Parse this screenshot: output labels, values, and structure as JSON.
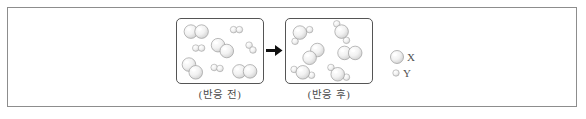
{
  "figure": {
    "type": "particle-model-reaction-diagram",
    "frame_color": "#8d8d8d",
    "panel_border_color": "#555555",
    "sphere_fill": "#efefef",
    "sphere_stroke": "#9a9a9a"
  },
  "panels": {
    "before": {
      "caption": "(반응 전)",
      "name": "before-reaction-panel",
      "molecules": [
        {
          "label": "X2",
          "atoms": [
            {
              "kind": "X",
              "cx": 14,
              "cy": 13,
              "r": 7.0
            },
            {
              "kind": "X",
              "cx": 25,
              "cy": 13,
              "r": 7.0
            }
          ]
        },
        {
          "label": "Y2",
          "atoms": [
            {
              "kind": "Y",
              "cx": 58,
              "cy": 11,
              "r": 3.4
            },
            {
              "kind": "Y",
              "cx": 64,
              "cy": 11,
              "r": 3.4
            }
          ]
        },
        {
          "label": "Y2",
          "atoms": [
            {
              "kind": "Y",
              "cx": 19,
              "cy": 30,
              "r": 3.4
            },
            {
              "kind": "Y",
              "cx": 25,
              "cy": 30,
              "r": 3.4
            }
          ]
        },
        {
          "label": "X2",
          "atoms": [
            {
              "kind": "X",
              "cx": 42,
              "cy": 27,
              "r": 7.0
            },
            {
              "kind": "X",
              "cx": 51,
              "cy": 33,
              "r": 7.0
            }
          ]
        },
        {
          "label": "Y2",
          "atoms": [
            {
              "kind": "Y",
              "cx": 74,
              "cy": 27,
              "r": 3.4
            },
            {
              "kind": "Y",
              "cx": 78,
              "cy": 32,
              "r": 3.4
            }
          ]
        },
        {
          "label": "X2",
          "atoms": [
            {
              "kind": "X",
              "cx": 12,
              "cy": 47,
              "r": 7.0
            },
            {
              "kind": "X",
              "cx": 19,
              "cy": 55,
              "r": 7.0
            }
          ]
        },
        {
          "label": "Y2",
          "atoms": [
            {
              "kind": "Y",
              "cx": 38,
              "cy": 50,
              "r": 3.4
            },
            {
              "kind": "Y",
              "cx": 44,
              "cy": 51,
              "r": 3.4
            }
          ]
        },
        {
          "label": "X2",
          "atoms": [
            {
              "kind": "X",
              "cx": 64,
              "cy": 54,
              "r": 7.0
            },
            {
              "kind": "X",
              "cx": 75,
              "cy": 54,
              "r": 7.0
            }
          ]
        }
      ]
    },
    "after": {
      "caption": "(반응 후)",
      "name": "after-reaction-panel",
      "molecules": [
        {
          "label": "XY2",
          "atoms": [
            {
              "kind": "X",
              "cx": 14,
              "cy": 14,
              "r": 7.0
            },
            {
              "kind": "Y",
              "cx": 24,
              "cy": 11,
              "r": 3.4
            },
            {
              "kind": "Y",
              "cx": 9,
              "cy": 23,
              "r": 3.4
            }
          ]
        },
        {
          "label": "XY2",
          "atoms": [
            {
              "kind": "X",
              "cx": 57,
              "cy": 13,
              "r": 7.0
            },
            {
              "kind": "Y",
              "cx": 52,
              "cy": 5,
              "r": 3.4
            },
            {
              "kind": "Y",
              "cx": 62,
              "cy": 22,
              "r": 3.4
            }
          ]
        },
        {
          "label": "X2",
          "atoms": [
            {
              "kind": "X",
              "cx": 32,
              "cy": 32,
              "r": 7.0
            },
            {
              "kind": "X",
              "cx": 24,
              "cy": 40,
              "r": 7.0
            }
          ]
        },
        {
          "label": "X2",
          "atoms": [
            {
              "kind": "X",
              "cx": 60,
              "cy": 35,
              "r": 7.0
            },
            {
              "kind": "X",
              "cx": 71,
              "cy": 35,
              "r": 7.0
            }
          ]
        },
        {
          "label": "XY2",
          "atoms": [
            {
              "kind": "X",
              "cx": 17,
              "cy": 55,
              "r": 7.0
            },
            {
              "kind": "Y",
              "cx": 8,
              "cy": 52,
              "r": 3.4
            },
            {
              "kind": "Y",
              "cx": 26,
              "cy": 58,
              "r": 3.4
            }
          ]
        },
        {
          "label": "XY2",
          "atoms": [
            {
              "kind": "X",
              "cx": 53,
              "cy": 57,
              "r": 7.0
            },
            {
              "kind": "Y",
              "cx": 46,
              "cy": 50,
              "r": 3.4
            },
            {
              "kind": "Y",
              "cx": 62,
              "cy": 60,
              "r": 3.4
            }
          ]
        }
      ]
    }
  },
  "arrow": {
    "name": "reaction-arrow",
    "direction": "right"
  },
  "legend": {
    "items": [
      {
        "label": "X",
        "kind": "X",
        "r": 6.5,
        "name": "legend-swatch-x"
      },
      {
        "label": "Y",
        "kind": "Y",
        "r": 3.2,
        "name": "legend-swatch-y"
      }
    ]
  }
}
